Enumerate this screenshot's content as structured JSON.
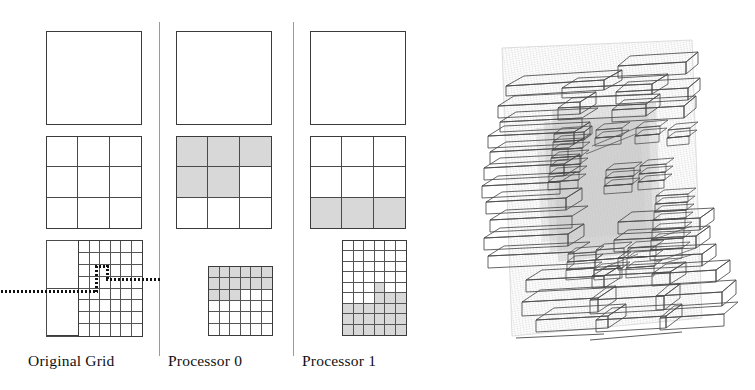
{
  "figure": {
    "kind": "amr-grid-decomposition-figure",
    "background": "#ffffff",
    "line_color": "#3b3b3b",
    "shade_color": "#d8d8d8",
    "width": 755,
    "height": 390
  },
  "captions": {
    "original_grid": "Original Grid",
    "processor_0": "Processor 0",
    "processor_1": "Processor 1"
  },
  "panels": {
    "original_grid": {
      "label": "Original Grid",
      "levels": [
        {
          "level": 0,
          "type": "single-cell",
          "rows": 1,
          "cols": 1,
          "shaded": []
        },
        {
          "level": 1,
          "type": "uniform-grid",
          "rows": 3,
          "cols": 3,
          "shaded": []
        },
        {
          "level": 2,
          "type": "composite",
          "coarse_region": {
            "rows": 2,
            "cols": 1,
            "fraction_width": 0.333
          },
          "fine_region": {
            "rows": 8,
            "cols": 6,
            "fraction_width": 0.667
          },
          "shaded": []
        }
      ],
      "interface_path": "dotted-L-shaped boundary marking the processor split line"
    },
    "processor_0": {
      "label": "Processor 0",
      "levels": [
        {
          "level": 0,
          "type": "single-cell",
          "rows": 1,
          "cols": 1,
          "shaded": []
        },
        {
          "level": 1,
          "type": "uniform-grid",
          "rows": 3,
          "cols": 3,
          "shaded": [
            [
              0,
              0
            ],
            [
              0,
              1
            ],
            [
              0,
              2
            ],
            [
              1,
              0
            ],
            [
              1,
              1
            ]
          ]
        },
        {
          "level": 2,
          "type": "uniform-grid",
          "rows": 6,
          "cols": 6,
          "shaded": [
            [
              0,
              0
            ],
            [
              0,
              1
            ],
            [
              0,
              2
            ],
            [
              0,
              3
            ],
            [
              0,
              4
            ],
            [
              0,
              5
            ],
            [
              1,
              0
            ],
            [
              1,
              1
            ],
            [
              1,
              2
            ],
            [
              1,
              3
            ],
            [
              1,
              4
            ],
            [
              1,
              5
            ],
            [
              2,
              0
            ],
            [
              2,
              1
            ],
            [
              2,
              2
            ]
          ]
        }
      ]
    },
    "processor_1": {
      "label": "Processor 1",
      "levels": [
        {
          "level": 0,
          "type": "single-cell",
          "rows": 1,
          "cols": 1,
          "shaded": []
        },
        {
          "level": 1,
          "type": "uniform-grid",
          "rows": 3,
          "cols": 3,
          "shaded": [
            [
              2,
              0
            ],
            [
              2,
              1
            ],
            [
              2,
              2
            ]
          ]
        },
        {
          "level": 2,
          "type": "uniform-grid",
          "rows": 9,
          "cols": 6,
          "shaded": [
            [
              4,
              3
            ],
            [
              5,
              3
            ],
            [
              5,
              4
            ],
            [
              5,
              5
            ],
            [
              6,
              0
            ],
            [
              6,
              1
            ],
            [
              6,
              2
            ],
            [
              6,
              3
            ],
            [
              6,
              4
            ],
            [
              6,
              5
            ],
            [
              7,
              0
            ],
            [
              7,
              1
            ],
            [
              7,
              2
            ],
            [
              7,
              3
            ],
            [
              7,
              4
            ],
            [
              7,
              5
            ],
            [
              8,
              0
            ],
            [
              8,
              1
            ],
            [
              8,
              2
            ],
            [
              8,
              3
            ],
            [
              8,
              4
            ],
            [
              8,
              5
            ]
          ]
        }
      ]
    }
  },
  "render_3d": {
    "title": "3D adaptive mesh refinement box hierarchy",
    "description": "Rotated perspective wireframe of many thin flattened refinement boxes nested inside a faint outer domain, drawn with fine hatch lines",
    "stroke_color": "#4a4a4a",
    "haze_color": "#b8b8b8",
    "view_rotation_deg": -10
  }
}
